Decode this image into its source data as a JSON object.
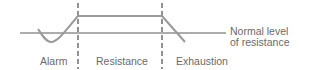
{
  "diagram": {
    "baseline_label_line1": "Normal level",
    "baseline_label_line2": "of resistance",
    "stages": [
      {
        "label": "Alarm"
      },
      {
        "label": "Resistance"
      },
      {
        "label": "Exhaustion"
      }
    ],
    "colors": {
      "curve": "#9a9a9a",
      "baseline": "#5a5a5a",
      "divider": "#4a4a4a",
      "text": "#6a6a6a"
    }
  }
}
